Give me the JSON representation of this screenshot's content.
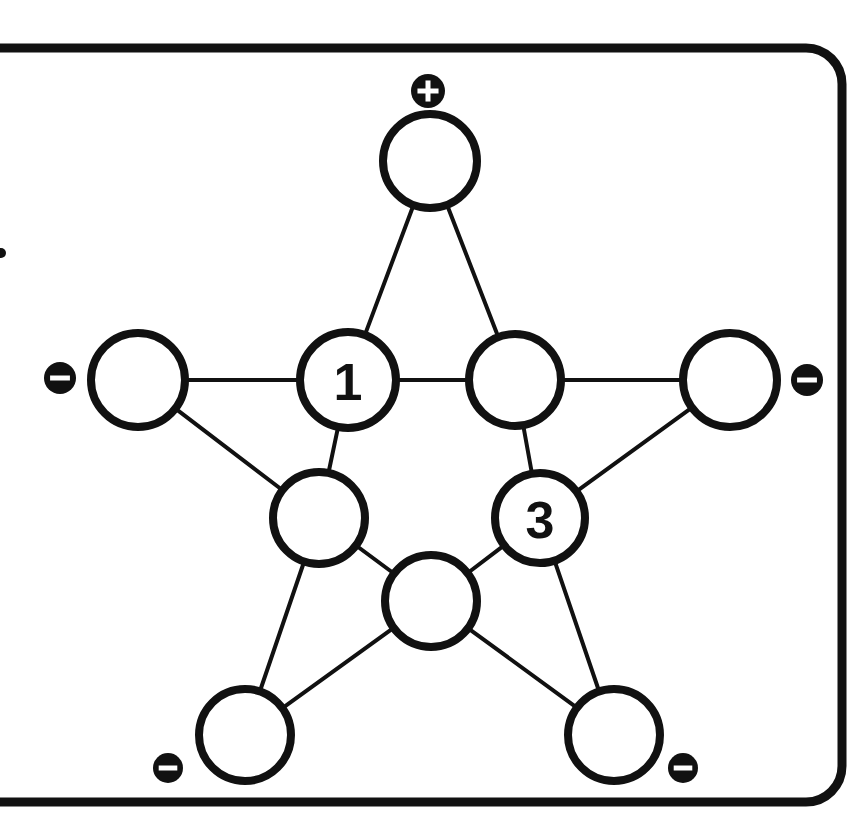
{
  "panel": {
    "name": "star-puzzle-panel",
    "border_color": "#111111",
    "background_color": "#ffffff",
    "corner_radius": 36,
    "border_width": 9,
    "bounds": {
      "x": -60,
      "y": 48,
      "width": 902,
      "height": 754
    }
  },
  "graph": {
    "type": "pentagram",
    "node_radius_outer": 47,
    "node_radius_inner": 46,
    "stroke_color": "#111111",
    "fill_color": "#ffffff",
    "nodes": [
      {
        "id": "top-point",
        "label": "",
        "cx": 430,
        "cy": 161,
        "r": 47,
        "role": "outer-point"
      },
      {
        "id": "left-point",
        "label": "",
        "cx": 138,
        "cy": 380,
        "r": 47,
        "role": "outer-point"
      },
      {
        "id": "right-point",
        "label": "",
        "cx": 730,
        "cy": 380,
        "r": 47,
        "role": "outer-point"
      },
      {
        "id": "bottom-left-point",
        "label": "",
        "cx": 245,
        "cy": 735,
        "r": 46,
        "role": "outer-point"
      },
      {
        "id": "bottom-right-point",
        "label": "",
        "cx": 614,
        "cy": 735,
        "r": 46,
        "role": "outer-point"
      },
      {
        "id": "inner-upper-left",
        "label": "1",
        "cx": 348,
        "cy": 380,
        "r": 48,
        "role": "inner-node"
      },
      {
        "id": "inner-upper-right",
        "label": "",
        "cx": 515,
        "cy": 380,
        "r": 46,
        "role": "inner-node"
      },
      {
        "id": "inner-right",
        "label": "3",
        "cx": 540,
        "cy": 518,
        "r": 45,
        "role": "inner-node"
      },
      {
        "id": "inner-bottom",
        "label": "",
        "cx": 431,
        "cy": 601,
        "r": 46,
        "role": "inner-node"
      },
      {
        "id": "inner-left",
        "label": "",
        "cx": 319,
        "cy": 518,
        "r": 46,
        "role": "inner-node"
      }
    ],
    "edges": [
      {
        "from": "top-point",
        "to": "inner-upper-left"
      },
      {
        "from": "top-point",
        "to": "inner-upper-right"
      },
      {
        "from": "left-point",
        "to": "inner-upper-left"
      },
      {
        "from": "left-point",
        "to": "inner-left"
      },
      {
        "from": "right-point",
        "to": "inner-upper-right"
      },
      {
        "from": "right-point",
        "to": "inner-right"
      },
      {
        "from": "bottom-left-point",
        "to": "inner-left"
      },
      {
        "from": "bottom-left-point",
        "to": "inner-bottom"
      },
      {
        "from": "bottom-right-point",
        "to": "inner-bottom"
      },
      {
        "from": "bottom-right-point",
        "to": "inner-right"
      },
      {
        "from": "inner-upper-left",
        "to": "inner-upper-right"
      },
      {
        "from": "inner-upper-right",
        "to": "inner-right"
      },
      {
        "from": "inner-right",
        "to": "inner-bottom"
      },
      {
        "from": "inner-bottom",
        "to": "inner-left"
      },
      {
        "from": "inner-left",
        "to": "inner-upper-left"
      }
    ]
  },
  "badges": [
    {
      "id": "badge-top",
      "glyph": "plus",
      "symbol": "+",
      "cx": 428,
      "cy": 91,
      "r": 17,
      "attached_to": "top-point"
    },
    {
      "id": "badge-left",
      "glyph": "minus",
      "symbol": "−",
      "cx": 60,
      "cy": 378,
      "r": 16,
      "attached_to": "left-point"
    },
    {
      "id": "badge-right",
      "glyph": "minus",
      "symbol": "−",
      "cx": 807,
      "cy": 380,
      "r": 16,
      "attached_to": "right-point"
    },
    {
      "id": "badge-bottom-left",
      "glyph": "minus",
      "symbol": "−",
      "cx": 168,
      "cy": 768,
      "r": 15,
      "attached_to": "bottom-left-point"
    },
    {
      "id": "badge-bottom-right",
      "glyph": "minus",
      "symbol": "−",
      "cx": 683,
      "cy": 768,
      "r": 15,
      "attached_to": "bottom-right-point"
    }
  ],
  "marks": [
    {
      "id": "left-edge-dot",
      "cx": 1,
      "cy": 253,
      "r": 5
    }
  ],
  "chart_data": {
    "type": "diagram",
    "title": "",
    "filled_values": {
      "inner-upper-left": "1",
      "inner-right": "3"
    },
    "sign_markers": {
      "plus": 1,
      "minus": 4
    }
  }
}
